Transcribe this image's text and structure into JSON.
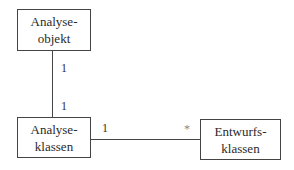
{
  "diagram": {
    "type": "uml-class-association",
    "nodes": [
      {
        "id": "analyseobjekt",
        "lines": [
          "Analyse-",
          "objekt"
        ]
      },
      {
        "id": "analyseklassen",
        "lines": [
          "Analyse-",
          "klassen"
        ]
      },
      {
        "id": "entwurfsklassen",
        "lines": [
          "Entwurfs-",
          "klassen"
        ]
      }
    ],
    "edges": [
      {
        "from": "analyseobjekt",
        "to": "analyseklassen",
        "from_multiplicity": "1",
        "to_multiplicity": "1"
      },
      {
        "from": "analyseklassen",
        "to": "entwurfsklassen",
        "from_multiplicity": "1",
        "to_multiplicity": "*"
      }
    ]
  }
}
